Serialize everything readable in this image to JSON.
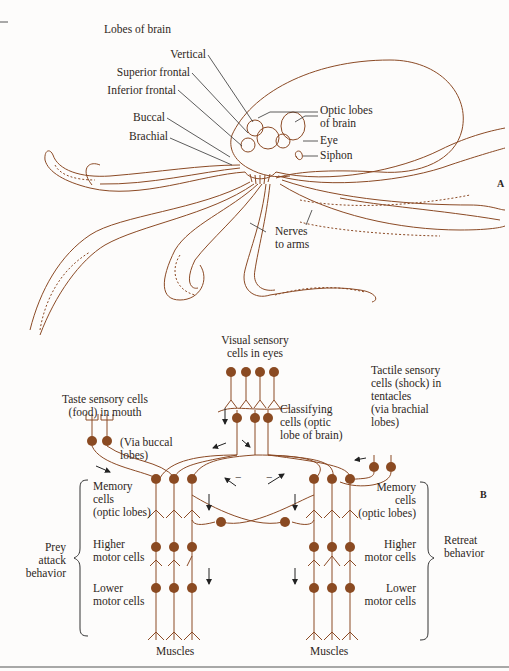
{
  "figure": {
    "colors": {
      "ink": "#8b4a25",
      "neuron_body": "#8a4a22",
      "text": "#2e2722",
      "background": "#fdfcfb",
      "rule": "#555555"
    },
    "panel_a": {
      "letter": "A",
      "title": "Lobes of brain",
      "brain_lobes": [
        "Vertical",
        "Superior frontal",
        "Inferior frontal",
        "Buccal",
        "Brachial"
      ],
      "labels": {
        "optic_lobes": "Optic lobes\nof brain",
        "eye": "Eye",
        "siphon": "Siphon",
        "nerves": "Nerves\nto arms"
      }
    },
    "panel_b": {
      "letter": "B",
      "visual": "Visual sensory\ncells in eyes",
      "classifying": "Classifying\ncells (optic\nlobe of brain)",
      "taste": "Taste sensory cells\n(food) in mouth",
      "via_buccal": "(Via buccal\nlobes)",
      "tactile": "Tactile sensory\ncells (shock) in\ntentacles\n(via brachial\nlobes)",
      "left": {
        "memory": "Memory\ncells\n(optic lobes)",
        "higher": "Higher\nmotor cells",
        "lower": "Lower\nmotor cells",
        "behavior": "Prey\nattack\nbehavior",
        "muscles": "Muscles"
      },
      "right": {
        "memory": "Memory\ncells\n(optic lobes)",
        "higher": "Higher\nmotor cells",
        "lower": "Lower\nmotor cells",
        "behavior": "Retreat\nbehavior",
        "muscles": "Muscles"
      },
      "inhibition_marks": [
        "−",
        "−"
      ]
    }
  }
}
